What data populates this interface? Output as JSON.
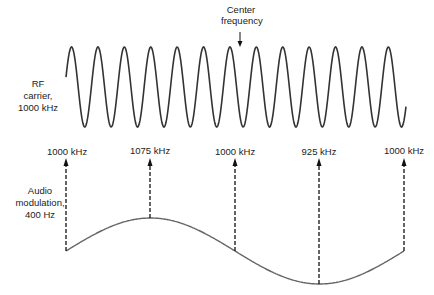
{
  "figure": {
    "top_annotation": {
      "line1": "Center",
      "line2": "frequency"
    },
    "rf_label": {
      "line1": "RF",
      "line2": "carrier,",
      "line3": "1000 kHz"
    },
    "audio_label": {
      "line1": "Audio",
      "line2": "modulation,",
      "line3": "400 Hz"
    },
    "frequency_markers": [
      {
        "label": "1000 kHz",
        "x": 66
      },
      {
        "label": "1075 kHz",
        "x": 150
      },
      {
        "label": "1000 kHz",
        "x": 235
      },
      {
        "label": "925 kHz",
        "x": 319
      },
      {
        "label": "1000 kHz",
        "x": 404
      }
    ],
    "colors": {
      "carrier": "#333333",
      "modulation": "#666666",
      "arrows": "#111111",
      "text": "#222222"
    }
  }
}
